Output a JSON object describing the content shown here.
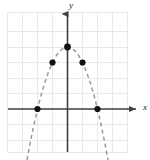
{
  "figure": {
    "width": 150,
    "height": 160,
    "background": "#ffffff"
  },
  "labels": {
    "y_axis": "y",
    "x_axis": "x"
  },
  "style": {
    "grid_color": "#e9e9ec",
    "axis_color": "#404040",
    "curve_color": "#9a9a9a",
    "point_color": "#111111"
  },
  "chart_data": {
    "type": "line",
    "title": "",
    "subtitle": "",
    "xlabel": "x",
    "ylabel": "y",
    "curve_label": "",
    "curve_style": "dashed",
    "grid": true,
    "legend": "none",
    "xlim": [
      -4,
      4
    ],
    "ylim": [
      -4,
      5
    ],
    "xticks": [
      -4,
      -3,
      -2,
      -1,
      0,
      1,
      2,
      3,
      4
    ],
    "yticks": [
      -4,
      -3,
      -2,
      -1,
      0,
      1,
      2,
      3,
      4,
      5
    ],
    "xtick_labels": [
      "",
      "",
      "",
      "",
      "",
      "",
      "",
      "",
      ""
    ],
    "ytick_labels": [
      "",
      "",
      "",
      "",
      "",
      "",
      "",
      "",
      "",
      ""
    ],
    "equation": "y = -x^2 + 4",
    "x": [
      -2.7,
      -2.5,
      -2.25,
      -2,
      -1.75,
      -1.5,
      -1.25,
      -1,
      -0.75,
      -0.5,
      -0.25,
      0,
      0.25,
      0.5,
      0.75,
      1,
      1.25,
      1.5,
      1.75,
      2,
      2.25,
      2.5,
      2.7
    ],
    "y": [
      -3.29,
      -2.25,
      -1.0625,
      0,
      0.9375,
      1.75,
      2.4375,
      3,
      3.4375,
      3.75,
      3.9375,
      4,
      3.9375,
      3.75,
      3.4375,
      3,
      2.4375,
      1.75,
      0.9375,
      0,
      -1.0625,
      -2.25,
      -3.29
    ],
    "marked_points": [
      {
        "x": -2,
        "y": 0,
        "role": "x-intercept-left"
      },
      {
        "x": -1,
        "y": 3,
        "role": "point-left"
      },
      {
        "x": 0,
        "y": 4,
        "role": "vertex"
      },
      {
        "x": 1,
        "y": 3,
        "role": "point-right"
      },
      {
        "x": 2,
        "y": 0,
        "role": "x-intercept-right"
      }
    ]
  }
}
